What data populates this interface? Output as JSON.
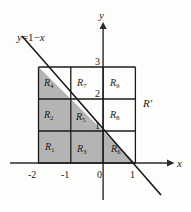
{
  "figure": {
    "type": "cartesian-grid-diagram",
    "background_color": "#fdfdfc",
    "shade_color": "#b4b4b4",
    "stroke_color": "#1a1a1a",
    "axes": {
      "x_label": "x",
      "y_label": "y",
      "x_ticks": [
        "-2",
        "-1",
        "0",
        "1"
      ],
      "y_ticks": [
        "3",
        "2",
        "1"
      ]
    },
    "line": {
      "label_y": "y",
      "label_eq": "=",
      "label_rhs_1": "1",
      "label_minus": "−",
      "label_rhs_x": "x",
      "full_label": "y = 1 − x"
    },
    "outer_region_label": "R",
    "outer_region_prime": "′",
    "regions": [
      {
        "id": "R1",
        "base": "R",
        "sub": "1",
        "shaded": true,
        "shape": "square",
        "col": 0,
        "row": 2
      },
      {
        "id": "R2",
        "base": "R",
        "sub": "2",
        "shaded": true,
        "shape": "square",
        "col": 0,
        "row": 1
      },
      {
        "id": "R3",
        "base": "R",
        "sub": "3",
        "shaded": true,
        "shape": "square",
        "col": 1,
        "row": 2
      },
      {
        "id": "R4",
        "base": "R",
        "sub": "4",
        "shaded": true,
        "shape": "triangle",
        "col": 0,
        "row": 0
      },
      {
        "id": "R5",
        "base": "R",
        "sub": "5",
        "shaded": true,
        "shape": "triangle",
        "col": 1,
        "row": 1
      },
      {
        "id": "R6",
        "base": "R",
        "sub": "6",
        "shaded": true,
        "shape": "triangle",
        "col": 2,
        "row": 2
      },
      {
        "id": "R7",
        "base": "R",
        "sub": "7",
        "shaded": false,
        "shape": "square",
        "col": 1,
        "row": 0
      },
      {
        "id": "R8",
        "base": "R",
        "sub": "8",
        "shaded": false,
        "shape": "square",
        "col": 2,
        "row": 1
      },
      {
        "id": "R9",
        "base": "R",
        "sub": "9",
        "shaded": false,
        "shape": "square",
        "col": 2,
        "row": 0
      }
    ]
  }
}
